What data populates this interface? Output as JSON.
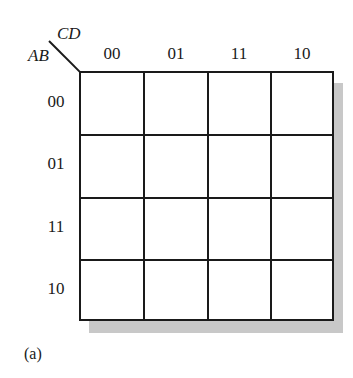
{
  "kmap": {
    "row_variables": "AB",
    "col_variables": "CD",
    "col_labels": [
      "00",
      "01",
      "11",
      "10"
    ],
    "row_labels": [
      "00",
      "01",
      "11",
      "10"
    ],
    "cells": [
      [
        "",
        "",
        "",
        ""
      ],
      [
        "",
        "",
        "",
        ""
      ],
      [
        "",
        "",
        "",
        ""
      ],
      [
        "",
        "",
        "",
        ""
      ]
    ]
  },
  "caption": "(a)",
  "colors": {
    "line": "#1a1a1a",
    "shadow": "#c8c8c8",
    "background": "#ffffff"
  }
}
